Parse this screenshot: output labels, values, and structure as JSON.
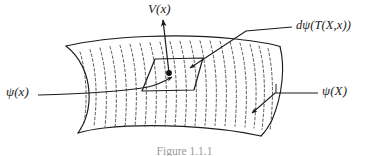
{
  "figure": {
    "caption": "Figure 1.1.1",
    "stroke_color": "#1b1b1b",
    "hatch_color": "#3a3a3a",
    "background": "#ffffff",
    "labels": {
      "vector_field": "V(x)",
      "differential": "dψ(T(X,x))",
      "section_lower": "ψ(x)",
      "section_upper": "ψ(X)"
    },
    "parts": {
      "surface": "curved-surface-sheet",
      "patch": "parallelogram-patch",
      "point": "base-point-dot",
      "vertical_arrow": "vertical-vector-arrow"
    }
  }
}
